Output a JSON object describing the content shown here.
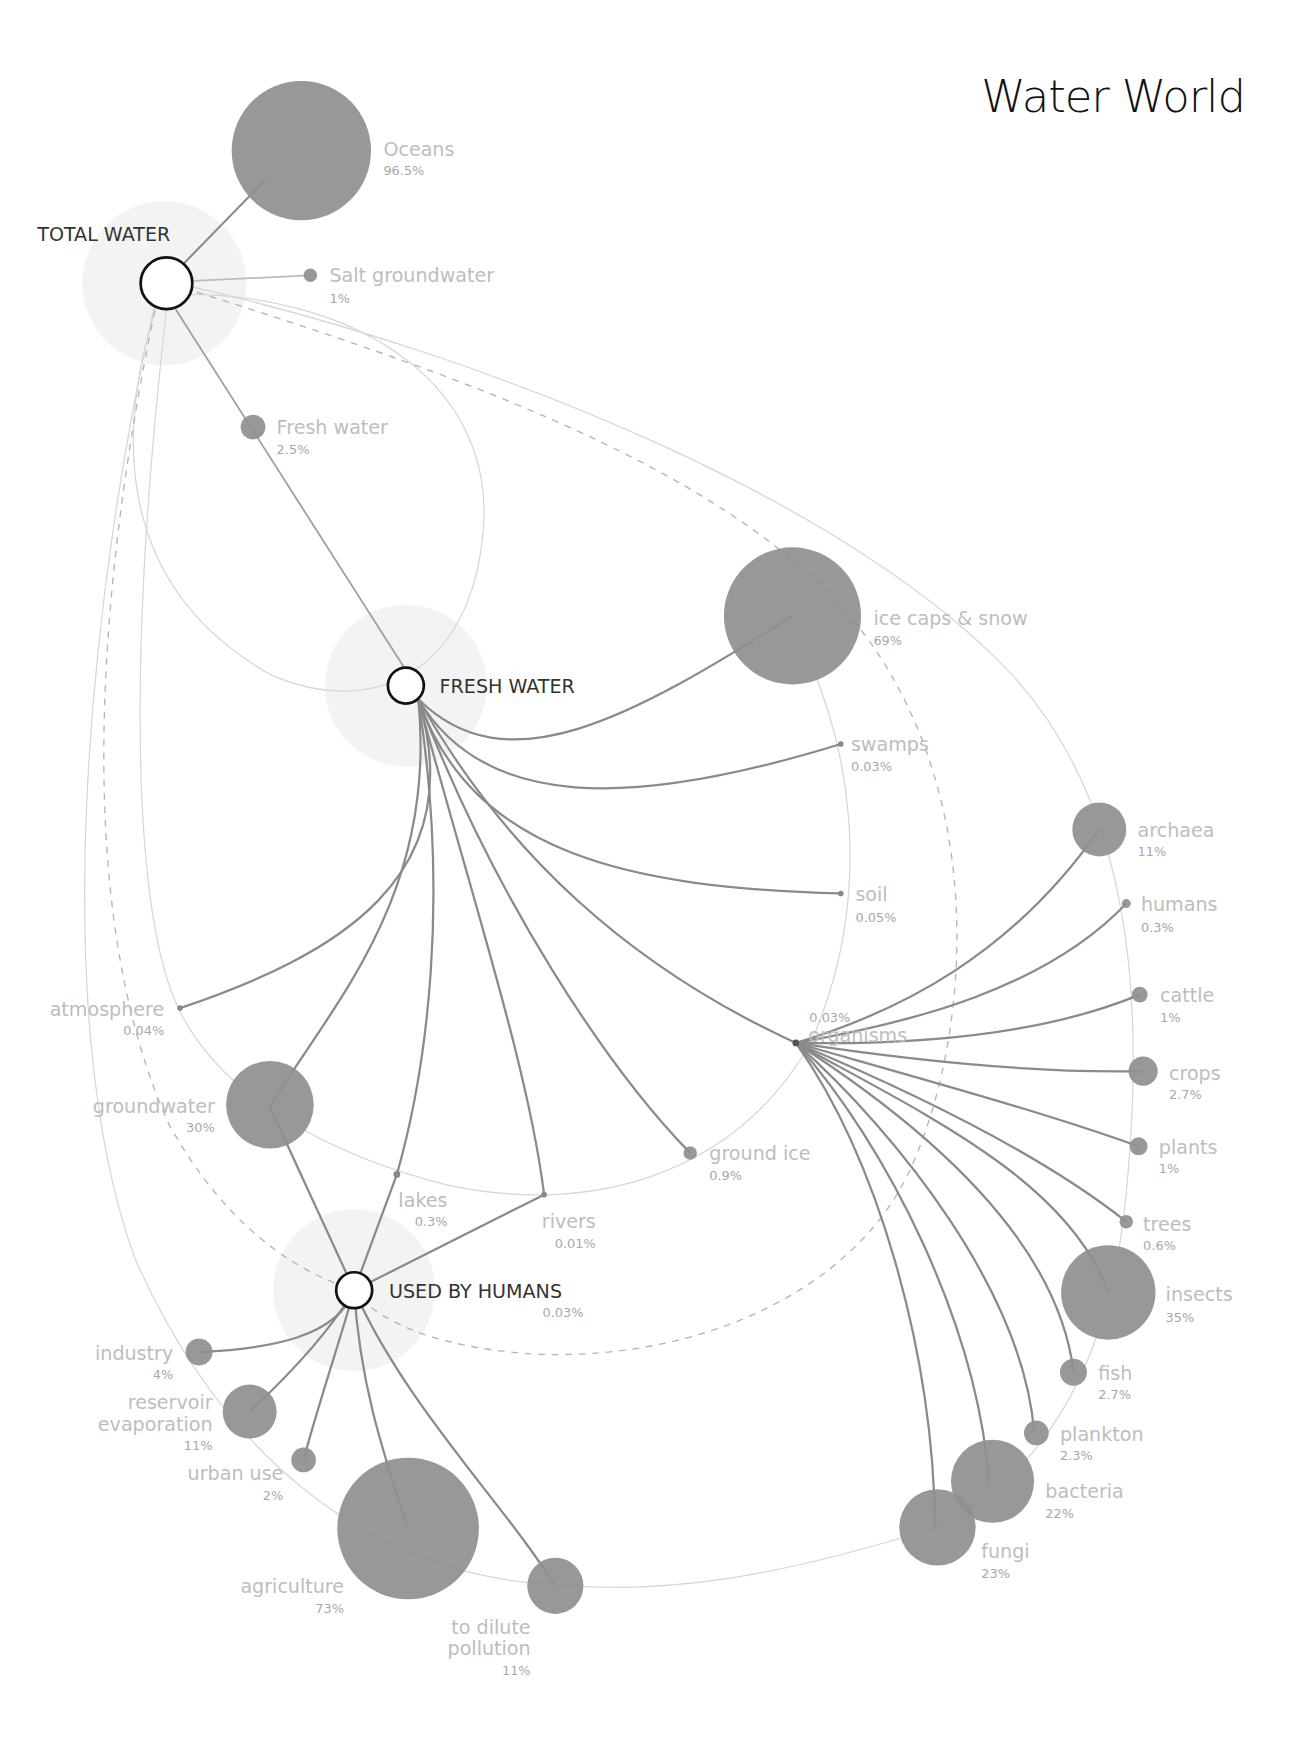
{
  "title": "Water World",
  "hubs": {
    "total": {
      "label": "TOTAL WATER"
    },
    "fresh": {
      "label": "FRESH WATER"
    },
    "humans": {
      "label": "USED BY HUMANS",
      "pct": "0.03%"
    },
    "organisms": {
      "label": "organisms",
      "pct": "0.03%"
    }
  },
  "total_water": [
    {
      "label": "Oceans",
      "pct": "96.5%"
    },
    {
      "label": "Salt groundwater",
      "pct": "1%"
    },
    {
      "label": "Fresh water",
      "pct": "2.5%"
    }
  ],
  "fresh_water": [
    {
      "label": "ice caps & snow",
      "pct": "69%"
    },
    {
      "label": "swamps",
      "pct": "0.03%"
    },
    {
      "label": "soil",
      "pct": "0.05%"
    },
    {
      "label": "atmosphere",
      "pct": "0.04%"
    },
    {
      "label": "groundwater",
      "pct": "30%"
    },
    {
      "label": "lakes",
      "pct": "0.3%"
    },
    {
      "label": "rivers",
      "pct": "0.01%"
    },
    {
      "label": "ground ice",
      "pct": "0.9%"
    }
  ],
  "organisms": [
    {
      "label": "archaea",
      "pct": "11%"
    },
    {
      "label": "humans",
      "pct": "0.3%"
    },
    {
      "label": "cattle",
      "pct": "1%"
    },
    {
      "label": "crops",
      "pct": "2.7%"
    },
    {
      "label": "plants",
      "pct": "1%"
    },
    {
      "label": "trees",
      "pct": "0.6%"
    },
    {
      "label": "insects",
      "pct": "35%"
    },
    {
      "label": "fish",
      "pct": "2.7%"
    },
    {
      "label": "plankton",
      "pct": "2.3%"
    },
    {
      "label": "bacteria",
      "pct": "22%"
    },
    {
      "label": "fungi",
      "pct": "23%"
    }
  ],
  "used_by_humans": [
    {
      "label": "industry",
      "pct": "4%"
    },
    {
      "label_line1": "reservoir",
      "label_line2": "evaporation",
      "pct": "11%"
    },
    {
      "label": "urban use",
      "pct": "2%"
    },
    {
      "label": "agriculture",
      "pct": "73%"
    },
    {
      "label_line1": "to dilute",
      "label_line2": "pollution",
      "pct": "11%"
    }
  ],
  "colors": {
    "blob": "#8f8f8f",
    "label": "#bdbdbd",
    "hub_stroke": "#111111",
    "halo": "#f3f3f3"
  }
}
